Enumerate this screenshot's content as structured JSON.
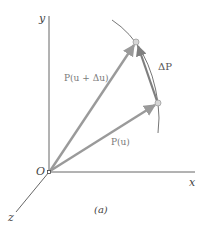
{
  "figure": {
    "caption": "(a)",
    "axes": {
      "x_label": "x",
      "y_label": "y",
      "z_label": "z",
      "origin_label": "O"
    },
    "vectors": [
      {
        "id": "p_u",
        "label": "P(u)"
      },
      {
        "id": "p_u_du",
        "label": "P(u + Δu)"
      },
      {
        "id": "delta_p",
        "label": "ΔP"
      }
    ],
    "colors": {
      "axis": "#555555",
      "vector": "#9a9a9a",
      "delta_vector": "#7f7f7f",
      "curve": "#666666",
      "point_fill": "#d6d6d6",
      "point_stroke": "#9e9e9e"
    }
  }
}
